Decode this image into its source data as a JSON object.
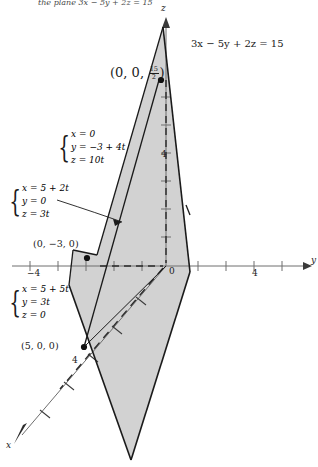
{
  "figure": {
    "type": "3d-coordinate-plane-diagram",
    "top_clipped_text": "the plane 3x − 5y + 2z = 15",
    "plane_equation": "3x − 5y + 2z = 15",
    "axes": {
      "z_label": "z",
      "y_label": "y",
      "x_label": "x",
      "origin_label": "0",
      "z_tick_label": "4",
      "y_tick_negative_label": "−4",
      "y_tick_positive_label": "4",
      "x_tick_label": "4"
    },
    "points": [
      {
        "name": "z-intercept",
        "label_prefix": "(0, 0, ",
        "label_suffix": ")",
        "fraction_num": "15",
        "fraction_den": "2"
      },
      {
        "name": "y-intercept",
        "label": "(0, −3, 0)"
      },
      {
        "name": "x-intercept",
        "label": "(5, 0, 0)"
      }
    ],
    "point_labels": {
      "z_intercept_open": "(0, 0, ",
      "z_intercept_close": ")",
      "z_intercept_num": "15",
      "z_intercept_den": "2",
      "y_intercept": "(0, −3, 0)",
      "x_intercept": "(5, 0, 0)"
    },
    "parametric_systems": [
      {
        "name": "line-in-yz-plane",
        "equations": [
          "x = 0",
          "y = −3 + 4t",
          "z = 10t"
        ]
      },
      {
        "name": "line-in-xz-plane",
        "equations": [
          "x = 5 + 2t",
          "y = 0",
          "z = 3t"
        ]
      },
      {
        "name": "line-in-xy-plane",
        "equations": [
          "x = 5 + 5t",
          "y = 3t",
          "z = 0"
        ]
      }
    ],
    "colors": {
      "plane_fill": "#d2d2d2",
      "stroke": "#1a1a1a",
      "axis": "#6e6e6e",
      "text": "#1a1a1a"
    }
  }
}
